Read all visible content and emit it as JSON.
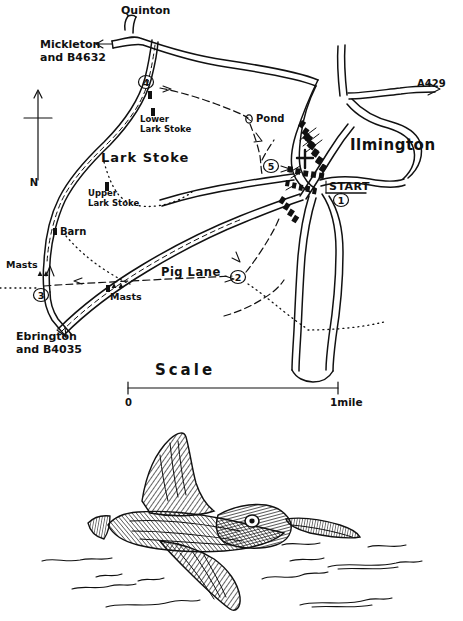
{
  "figure": {
    "type": "hand-drawn-walk-route-map",
    "background_color": "#ffffff",
    "ink_color": "#111111"
  },
  "map": {
    "title_place": "Ilmington",
    "place_labels": [
      {
        "id": "quinton",
        "text": "Quinton",
        "x": 121,
        "y": 14
      },
      {
        "id": "mickleton",
        "text": "Mickleton",
        "x": 40,
        "y": 45
      },
      {
        "id": "mickleton_road",
        "text": "and B4632",
        "x": 40,
        "y": 58
      },
      {
        "id": "lower_lark_1",
        "text": "Lower",
        "x": 142,
        "y": 120
      },
      {
        "id": "lower_lark_2",
        "text": "Lark Stoke",
        "x": 142,
        "y": 131
      },
      {
        "id": "lark_stoke",
        "text": "Lark Stoke",
        "x": 103,
        "y": 159
      },
      {
        "id": "upper_lark_1",
        "text": "Upper",
        "x": 88,
        "y": 194
      },
      {
        "id": "upper_lark_2",
        "text": "Lark Stoke",
        "x": 88,
        "y": 205
      },
      {
        "id": "barn",
        "text": "Barn",
        "x": 60,
        "y": 232
      },
      {
        "id": "masts_left",
        "text": "Masts",
        "x": 8,
        "y": 265
      },
      {
        "id": "masts_mid",
        "text": "Masts",
        "x": 113,
        "y": 296
      },
      {
        "id": "pig_lane",
        "text": "Pig Lane",
        "x": 163,
        "y": 272
      },
      {
        "id": "pond",
        "text": "Pond",
        "x": 255,
        "y": 119
      },
      {
        "id": "ebrington_1",
        "text": "Ebrington",
        "x": 18,
        "y": 337
      },
      {
        "id": "ebrington_2",
        "text": "and B4035",
        "x": 18,
        "y": 350
      },
      {
        "id": "ilmington",
        "text": "Ilmington",
        "x": 352,
        "y": 146
      },
      {
        "id": "a429",
        "text": "A429",
        "x": 427,
        "y": 84
      },
      {
        "id": "start",
        "text": "START",
        "x": 331,
        "y": 192
      }
    ],
    "waypoints": [
      {
        "number": "1",
        "x": 341,
        "y": 200
      },
      {
        "number": "2",
        "x": 238,
        "y": 277
      },
      {
        "number": "3",
        "x": 41,
        "y": 295
      },
      {
        "number": "4",
        "x": 146,
        "y": 82
      },
      {
        "number": "5",
        "x": 271,
        "y": 166
      }
    ],
    "symbols": [
      {
        "name": "church-cross-icon",
        "x": 305,
        "y": 158
      },
      {
        "name": "compass-north-arrow",
        "x": 38,
        "y": 90
      },
      {
        "name": "north-letter",
        "text": "N",
        "x": 34,
        "y": 183
      }
    ]
  },
  "scale_bar": {
    "label": "Scale",
    "start_label": "0",
    "end_label": "1mile",
    "x_start": 128,
    "x_end": 338,
    "y": 385
  },
  "illustration": {
    "name": "bird-in-flight-drawing",
    "caption": "",
    "subject": "flying bird (pen and ink hatching)"
  }
}
